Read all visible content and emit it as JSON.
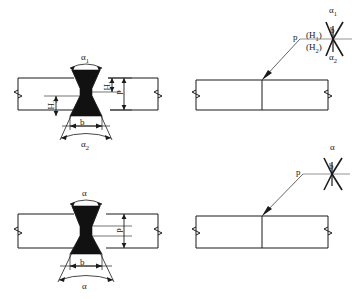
{
  "figure": {
    "type": "engineering-drawing",
    "background_color": "#ffffff",
    "line_color": "#1a1a1a",
    "weld_fill_color": "#111111",
    "symbol_line_color": "#333333"
  },
  "panels": [
    {
      "id": "top-left",
      "name": "asymmetric-double-v-groove-section",
      "description": "Plate cross-section with asymmetric double-V (X) groove weld bead",
      "labels": {
        "top_angle": "α",
        "top_angle_sub": "1",
        "bottom_angle": "α",
        "bottom_angle_sub": "2",
        "root_gap": "b",
        "height_upper": "H",
        "height_upper_sub": "1",
        "height_lower": "H",
        "height_lower_sub": "2",
        "root_face": "p"
      }
    },
    {
      "id": "top-right",
      "name": "asymmetric-double-v-weld-symbol",
      "description": "Welding symbol with leader line and double-V symbol",
      "labels": {
        "root_face": "p",
        "height_upper": "(H",
        "height_upper_sub": "1",
        "height_upper_close": ")",
        "height_lower": "(H",
        "height_lower_sub": "2",
        "height_lower_close": ")",
        "root_gap": "b",
        "top_angle": "α",
        "top_angle_sub": "1",
        "bottom_angle": "α",
        "bottom_angle_sub": "2"
      }
    },
    {
      "id": "bottom-left",
      "name": "symmetric-double-v-groove-section",
      "description": "Plate cross-section with symmetric double-V (X) groove weld bead",
      "labels": {
        "top_angle": "α",
        "bottom_angle": "α",
        "root_gap": "b",
        "root_face": "p"
      }
    },
    {
      "id": "bottom-right",
      "name": "symmetric-double-v-weld-symbol",
      "description": "Welding symbol with leader line and symmetric double-V symbol",
      "labels": {
        "root_face": "p",
        "root_gap": "b",
        "angle": "α"
      }
    }
  ]
}
